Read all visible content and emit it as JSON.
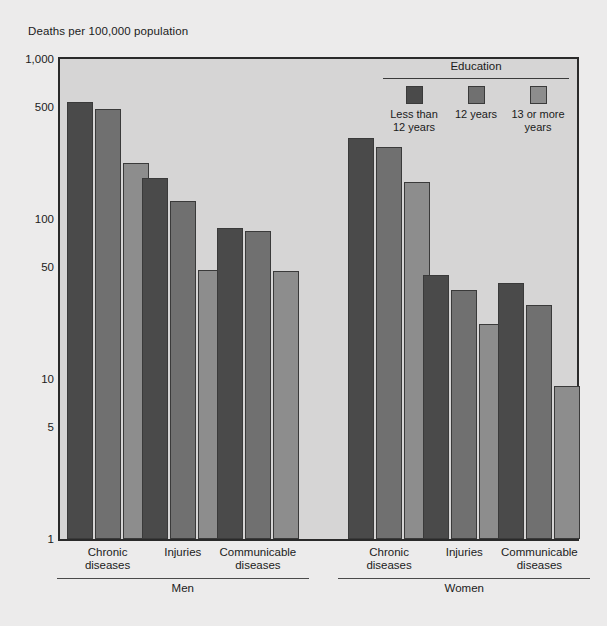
{
  "chart_data": {
    "type": "bar",
    "title": "Deaths per 100,000 population",
    "xlabel": "",
    "ylabel": "Deaths per 100,000 population",
    "yscale": "log",
    "ylim": [
      1,
      1000
    ],
    "yticks": [
      1,
      5,
      10,
      50,
      100,
      500,
      1000
    ],
    "ytick_labels": [
      "1",
      "5",
      "10",
      "50",
      "100",
      "500",
      "1,000"
    ],
    "grid": false,
    "legend_title": "Education",
    "legend_position": "top-right-inside",
    "series": [
      {
        "name": "Less than\n12 years",
        "color": "#4a4a4a",
        "values": [
          540,
          180,
          88,
          320,
          45,
          40
        ]
      },
      {
        "name": "12 years",
        "color": "#707070",
        "values": [
          490,
          130,
          84,
          280,
          36,
          29
        ]
      },
      {
        "name": "13 or more\nyears",
        "color": "#8d8d8d",
        "values": [
          225,
          48,
          47,
          170,
          22,
          9
        ]
      }
    ],
    "categories": [
      "Chronic\ndiseases",
      "Injuries",
      "Communicable\ndiseases",
      "Chronic\ndiseases",
      "Injuries",
      "Communicable\ndiseases"
    ],
    "groups": [
      {
        "label": "Men",
        "categories": [
          0,
          1,
          2
        ]
      },
      {
        "label": "Women",
        "categories": [
          3,
          4,
          5
        ]
      }
    ],
    "colors": {
      "plot_background": "#d6d5d5",
      "page_background": "#ecebeb",
      "axis": "#2a2a2a",
      "text": "#1b1b1b"
    }
  }
}
